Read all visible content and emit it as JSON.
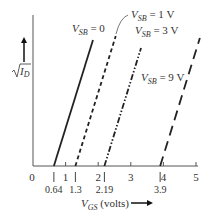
{
  "chart_data": {
    "type": "line",
    "title": "",
    "xlabel": "V_GS (volts)",
    "ylabel": "√I_D",
    "xlim": [
      0,
      5
    ],
    "x_ticks": [
      0,
      1,
      2,
      3,
      4,
      5
    ],
    "x_tick_labels": [
      "0",
      "1",
      "2",
      "3",
      "4",
      "5"
    ],
    "threshold_marks": [
      0.64,
      1.3,
      2.19,
      3.9
    ],
    "threshold_labels": [
      "0.64",
      "1.3",
      "2.19",
      "3.9"
    ],
    "grid": false,
    "legend": "inline labels",
    "series": [
      {
        "name": "V_SB = 0",
        "label_main": "V",
        "label_sub": "SB",
        "label_rest": " = 0",
        "style": "solid",
        "x_intercept": 0.64,
        "x_top": 1.84
      },
      {
        "name": "V_SB = 1 V",
        "label_main": "V",
        "label_sub": "SB",
        "label_rest": " = 1 V",
        "style": "dashed",
        "x_intercept": 1.3,
        "x_top": 2.5
      },
      {
        "name": "V_SB = 3 V",
        "label_main": "V",
        "label_sub": "SB",
        "label_rest": " = 3 V",
        "style": "dash-dot-dot",
        "x_intercept": 2.19,
        "x_top": 3.39
      },
      {
        "name": "V_SB = 9 V",
        "label_main": "V",
        "label_sub": "SB",
        "label_rest": " = 9 V",
        "style": "long-dash",
        "x_intercept": 3.9,
        "x_top": 5.1
      }
    ]
  },
  "axes": {
    "x_label_main": "V",
    "x_label_sub": "GS",
    "x_label_rest": " (volts)",
    "y_label_radicand_main": "I",
    "y_label_radicand_sub": "D"
  }
}
